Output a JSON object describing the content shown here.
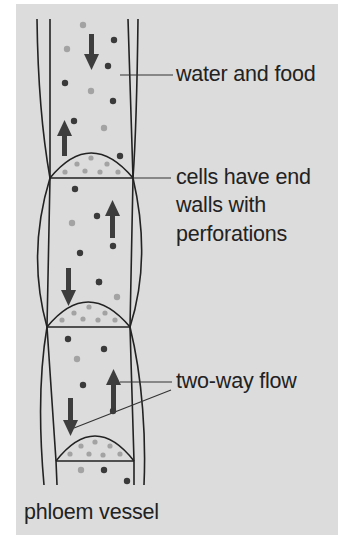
{
  "diagram": {
    "title": "phloem vessel",
    "labels": {
      "water_food": "water and food",
      "end_walls_line1": "cells have end",
      "end_walls_line2": "walls with",
      "end_walls_line3": "perforations",
      "two_way": "two-way flow",
      "vessel": "phloem vessel"
    },
    "colors": {
      "background": "#dcdcdc",
      "lines": "#222222",
      "arrow": "#3d3d3d",
      "dark_dot": "#3a3a3a",
      "light_dot": "#a3a3a3"
    }
  }
}
